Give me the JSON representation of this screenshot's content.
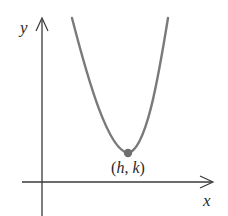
{
  "diagram": {
    "type": "parabola-graph",
    "axes": {
      "x_label": "x",
      "y_label": "y",
      "color": "#3a3a3a"
    },
    "curve": {
      "kind": "upward-opening parabola",
      "color": "#7a7a7a"
    },
    "vertex": {
      "label_open": "(",
      "label_h": "h",
      "label_sep": ", ",
      "label_k": "k",
      "label_close": ")",
      "dot_color": "#6e6e6e"
    }
  }
}
